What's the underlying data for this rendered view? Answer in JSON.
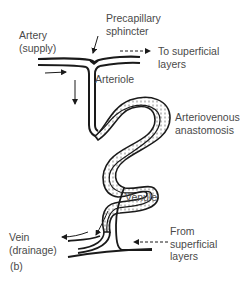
{
  "figure": {
    "panel_label": "(b)",
    "labels": {
      "artery_line1": "Artery",
      "artery_line2": "(supply)",
      "sphincter_line1": "Precapillary",
      "sphincter_line2": "sphincter",
      "to_superficial_line1": "To superficial",
      "to_superficial_line2": "layers",
      "arteriole": "Arteriole",
      "ava_line1": "Arteriovenous",
      "ava_line2": "anastomosis",
      "venule": "Venule",
      "vein_line1": "Vein",
      "vein_line2": "(drainage)",
      "from_superficial_line1": "From",
      "from_superficial_line2": "superficial",
      "from_superficial_line3": "layers"
    },
    "colors": {
      "line": "#1a1a1a",
      "text": "#4a4a4a",
      "background": "#ffffff"
    }
  }
}
